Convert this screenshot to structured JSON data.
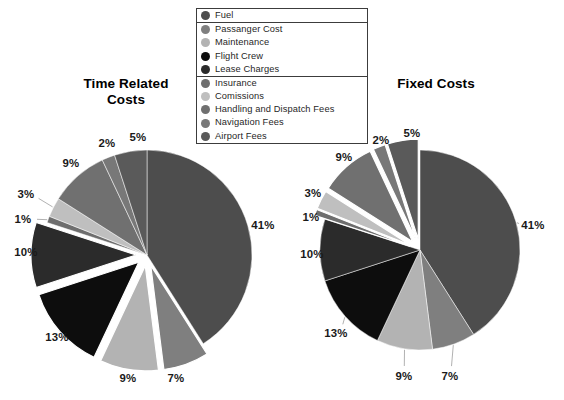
{
  "legend": {
    "groups": [
      {
        "name": "group-1",
        "items": [
          {
            "label": "Fuel",
            "color": "#4d4d4d"
          }
        ]
      },
      {
        "name": "group-2",
        "items": [
          {
            "label": "Passanger Cost",
            "color": "#7f7f7f"
          },
          {
            "label": "Maintenance",
            "color": "#b3b3b3"
          },
          {
            "label": "Flight Crew",
            "color": "#0d0d0d"
          },
          {
            "label": "Lease Charges",
            "color": "#2b2b2b"
          }
        ]
      },
      {
        "name": "group-3",
        "items": [
          {
            "label": "Insurance",
            "color": "#6e6e6e"
          },
          {
            "label": "Comissions",
            "color": "#bfbfbf"
          },
          {
            "label": "Handling and Dispatch Fees",
            "color": "#707070"
          },
          {
            "label": "Navigation Fees",
            "color": "#787878"
          },
          {
            "label": "Airport Fees",
            "color": "#5a5a5a"
          }
        ]
      }
    ]
  },
  "charts": [
    {
      "name": "time-related-costs",
      "title": "Time Related\nCosts",
      "title_line1": "Time Related",
      "title_line2": "Costs"
    },
    {
      "name": "fixed-costs",
      "title": "Fixed Costs",
      "title_line1": "Fixed Costs",
      "title_line2": ""
    }
  ],
  "chart_data": [
    {
      "type": "pie",
      "title": "Time Related Costs",
      "labels": [
        "Fuel",
        "Passanger Cost",
        "Maintenance",
        "Flight Crew",
        "Lease Charges",
        "Insurance",
        "Comissions",
        "Handling and Dispatch Fees",
        "Navigation Fees",
        "Airport Fees"
      ],
      "values": [
        41,
        7,
        9,
        13,
        10,
        1,
        3,
        9,
        2,
        5
      ],
      "value_labels": [
        "41%",
        "7%",
        "9%",
        "13%",
        "10%",
        "1%",
        "3%",
        "9%",
        "2%",
        "5%"
      ],
      "colors": [
        "#4d4d4d",
        "#7f7f7f",
        "#b3b3b3",
        "#0d0d0d",
        "#2b2b2b",
        "#6e6e6e",
        "#bfbfbf",
        "#707070",
        "#787878",
        "#5a5a5a"
      ],
      "exploded": [
        false,
        true,
        true,
        true,
        true,
        false,
        false,
        false,
        false,
        false
      ],
      "units": "percent",
      "legend_position": "top-center",
      "start_angle_deg": -90,
      "direction": "clockwise"
    },
    {
      "type": "pie",
      "title": "Fixed Costs",
      "labels": [
        "Fuel",
        "Passanger Cost",
        "Maintenance",
        "Flight Crew",
        "Lease Charges",
        "Insurance",
        "Comissions",
        "Handling and Dispatch Fees",
        "Navigation Fees",
        "Airport Fees"
      ],
      "values": [
        41,
        7,
        9,
        13,
        10,
        1,
        3,
        9,
        2,
        5
      ],
      "value_labels": [
        "41%",
        "7%",
        "9%",
        "13%",
        "10%",
        "1%",
        "3%",
        "9%",
        "2%",
        "5%"
      ],
      "colors": [
        "#4d4d4d",
        "#7f7f7f",
        "#b3b3b3",
        "#0d0d0d",
        "#2b2b2b",
        "#6e6e6e",
        "#bfbfbf",
        "#707070",
        "#787878",
        "#5a5a5a"
      ],
      "exploded": [
        false,
        false,
        false,
        false,
        false,
        true,
        true,
        true,
        true,
        true
      ],
      "units": "percent",
      "legend_position": "top-center",
      "start_angle_deg": -90,
      "direction": "clockwise"
    }
  ]
}
